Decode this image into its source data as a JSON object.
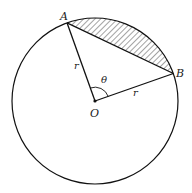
{
  "diagram": {
    "points": {
      "A": {
        "label": "A",
        "x": 67,
        "y": 20
      },
      "B": {
        "label": "B",
        "x": 173,
        "y": 73
      },
      "O": {
        "label": "O",
        "x": 95,
        "y": 101
      }
    },
    "labels": {
      "A": "A",
      "B": "B",
      "O": "O",
      "theta": "θ",
      "r_OA": "r",
      "r_OB": "r"
    },
    "circle": {
      "cx": 95,
      "cy": 101,
      "r": 83
    },
    "shaded_region": "segment between chord AB and minor arc AB (hatched)",
    "colors": {
      "stroke": "#111111",
      "hatch": "#333333",
      "background": "#ffffff"
    }
  }
}
